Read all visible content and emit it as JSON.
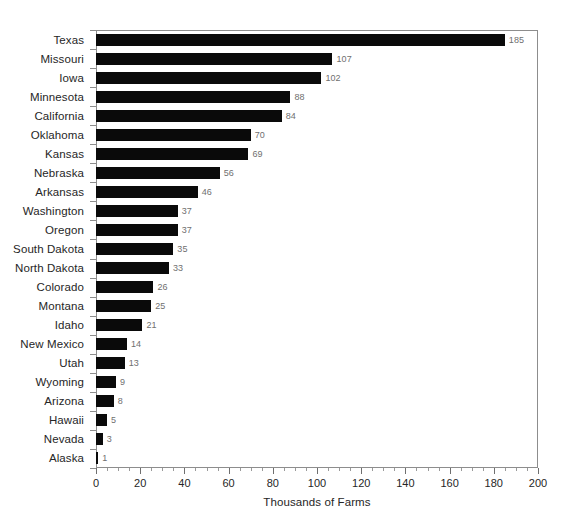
{
  "chart_data": {
    "type": "bar",
    "orientation": "horizontal",
    "title": "",
    "xlabel": "Thousands of Farms",
    "ylabel": "",
    "xlim": [
      0,
      200
    ],
    "xticks": [
      0,
      20,
      40,
      60,
      80,
      100,
      120,
      140,
      160,
      180,
      200
    ],
    "minor_tick_step": 5,
    "grid": false,
    "legend": null,
    "value_labels": true,
    "bar_color": "#0a0a0a",
    "value_label_color": "#6f6f6f",
    "axis_color": "#8d8d8d",
    "background": "#ffffff",
    "categories": [
      "Texas",
      "Missouri",
      "Iowa",
      "Minnesota",
      "California",
      "Oklahoma",
      "Kansas",
      "Nebraska",
      "Arkansas",
      "Washington",
      "Oregon",
      "South Dakota",
      "North Dakota",
      "Colorado",
      "Montana",
      "Idaho",
      "New Mexico",
      "Utah",
      "Wyoming",
      "Arizona",
      "Hawaii",
      "Nevada",
      "Alaska"
    ],
    "values": [
      185,
      107,
      102,
      88,
      84,
      70,
      69,
      56,
      46,
      37,
      37,
      35,
      33,
      26,
      25,
      21,
      14,
      13,
      9,
      8,
      5,
      3,
      1
    ]
  }
}
